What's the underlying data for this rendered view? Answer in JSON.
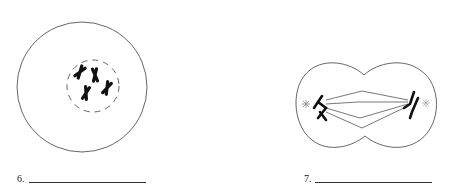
{
  "figures": [
    {
      "number_label": "6.",
      "stage_description": "cell with condensed chromosomes inside dashed nuclear envelope",
      "answer": ""
    },
    {
      "number_label": "7.",
      "stage_description": "dividing cell with chromosomes pulled to opposite poles along spindle fibers",
      "answer": ""
    }
  ],
  "colors": {
    "outline": "#555555",
    "chromosome": "#111111",
    "background": "#ffffff"
  }
}
